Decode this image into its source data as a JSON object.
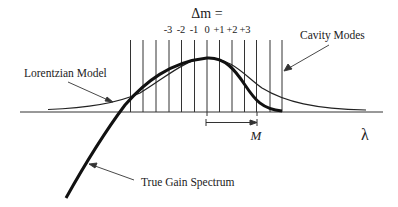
{
  "diagram": {
    "header": {
      "delta_m_label": "Δm =",
      "mode_indices": [
        "-3",
        "-2",
        "-1",
        "0",
        "+1",
        "+2",
        "+3"
      ]
    },
    "labels": {
      "cavity_modes": "Cavity Modes",
      "lorentzian_model": "Lorentzian Model",
      "true_gain_spectrum": "True Gain Spectrum",
      "m_span": "M",
      "wavelength_axis": "λ"
    },
    "mode_lines_x": [
      130.5,
      143,
      156,
      169,
      181.5,
      194.5,
      207,
      219.5,
      232,
      244.5,
      256.5,
      270,
      282
    ],
    "colors": {
      "line": "#222222",
      "background": "#ffffff"
    }
  }
}
